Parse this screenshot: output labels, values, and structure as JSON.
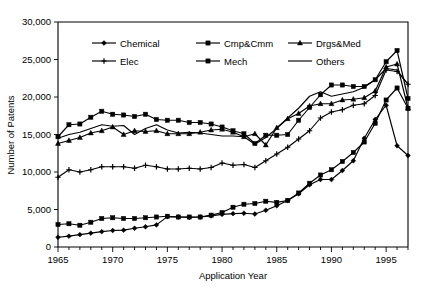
{
  "chart_data": {
    "type": "line",
    "title": "",
    "xlabel": "Application Year",
    "ylabel": "Number of Patents",
    "xlim": [
      1965,
      1997
    ],
    "ylim": [
      0,
      30000
    ],
    "xticks": [
      1965,
      1970,
      1975,
      1980,
      1985,
      1990,
      1995
    ],
    "xtick_labels": [
      "1965",
      "1970",
      "1975",
      "1980",
      "1985",
      "1990",
      "1995"
    ],
    "yticks": [
      0,
      5000,
      10000,
      15000,
      20000,
      25000,
      30000
    ],
    "ytick_labels": [
      "0",
      "5,000",
      "10,000",
      "15,000",
      "20,000",
      "25,000",
      "30,000"
    ],
    "grid": false,
    "legend_position": "upper-left-inside",
    "x": [
      1965,
      1966,
      1967,
      1968,
      1969,
      1970,
      1971,
      1972,
      1973,
      1974,
      1975,
      1976,
      1977,
      1978,
      1979,
      1980,
      1981,
      1982,
      1983,
      1984,
      1985,
      1986,
      1987,
      1988,
      1989,
      1990,
      1991,
      1992,
      1993,
      1994,
      1995,
      1996,
      1997
    ],
    "series": [
      {
        "name": "Chemical",
        "marker": "diamond",
        "values": [
          1300,
          1450,
          1650,
          1850,
          2050,
          2200,
          2250,
          2500,
          2700,
          2950,
          4050,
          4000,
          3950,
          4000,
          4150,
          4350,
          4450,
          4500,
          4400,
          4900,
          5500,
          6200,
          7100,
          8300,
          9000,
          9000,
          10200,
          11500,
          14500,
          17000,
          18900,
          13500,
          12200
        ]
      },
      {
        "name": "Cmp&Cmm",
        "marker": "square",
        "values": [
          14700,
          16300,
          16400,
          17300,
          18100,
          17700,
          17600,
          17400,
          17700,
          17000,
          16900,
          16900,
          16600,
          16600,
          16400,
          16000,
          15500,
          15100,
          13800,
          14900,
          14900,
          15000,
          16900,
          18600,
          20300,
          21600,
          21600,
          21400,
          21400,
          22300,
          24700,
          26200,
          19800
        ]
      },
      {
        "name": "Drgs&Med",
        "marker": "triangle",
        "values": [
          13800,
          14200,
          14600,
          15200,
          15500,
          16000,
          15000,
          15500,
          15400,
          15500,
          15100,
          15100,
          15100,
          15300,
          15600,
          15700,
          15300,
          14700,
          15100,
          13600,
          15900,
          17100,
          17800,
          18800,
          19100,
          19100,
          19600,
          19700,
          19900,
          20800,
          24000,
          24400,
          18500
        ]
      },
      {
        "name": "Elec",
        "marker": "plus",
        "values": [
          9300,
          10300,
          10000,
          10300,
          10700,
          10700,
          10700,
          10500,
          10900,
          10700,
          10400,
          10400,
          10500,
          10400,
          10600,
          11200,
          10900,
          11000,
          10600,
          11500,
          12400,
          13300,
          14400,
          15500,
          17200,
          18000,
          18300,
          18900,
          19100,
          20200,
          23600,
          23400,
          21700
        ]
      },
      {
        "name": "Mech",
        "marker": "square",
        "values": [
          3000,
          3100,
          2900,
          3300,
          3800,
          3900,
          3800,
          3800,
          3900,
          4000,
          4100,
          4000,
          4000,
          4000,
          4250,
          4600,
          5300,
          5700,
          5800,
          6100,
          5950,
          6200,
          7200,
          8500,
          9600,
          10300,
          11400,
          12600,
          14000,
          16500,
          19600,
          21200,
          18500
        ]
      },
      {
        "name": "Others",
        "marker": "none",
        "values": [
          14500,
          15000,
          15300,
          15800,
          16300,
          16100,
          16200,
          15000,
          15800,
          16300,
          15600,
          15200,
          15300,
          15200,
          15000,
          14800,
          14800,
          14700,
          13700,
          14600,
          15800,
          17200,
          18500,
          20100,
          20700,
          20100,
          20400,
          20700,
          21300,
          22300,
          23800,
          23600,
          21700
        ]
      }
    ]
  },
  "legend": {
    "items": [
      {
        "label": "Chemical",
        "marker": "diamond"
      },
      {
        "label": "Cmp&Cmm",
        "marker": "square"
      },
      {
        "label": "Drgs&Med",
        "marker": "triangle"
      },
      {
        "label": "Elec",
        "marker": "plus"
      },
      {
        "label": "Mech",
        "marker": "square"
      },
      {
        "label": "Others",
        "marker": "none"
      }
    ]
  },
  "colors": {
    "line": "#000000",
    "axis": "#000000",
    "background": "#ffffff"
  }
}
